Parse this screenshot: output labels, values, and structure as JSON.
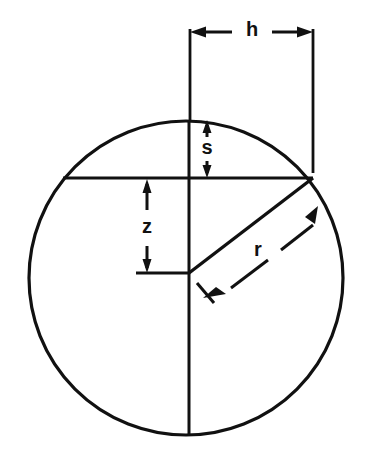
{
  "figure": {
    "type": "geometric-diagram",
    "background_color": "#ffffff",
    "line_color": "#111111"
  },
  "labels": {
    "h": "h",
    "s": "s",
    "z": "z",
    "r": "r"
  },
  "geometry": {
    "circle": {
      "center_x": 186,
      "center_y": 278,
      "radius": 157
    },
    "vertical_diameter": {
      "x": 189,
      "y_top": 121,
      "y_bottom": 435
    },
    "chord": {
      "y": 178,
      "x_left": 63,
      "x_right": 313
    },
    "h_dimension": {
      "y": 32,
      "x_start": 190,
      "x_end": 313,
      "label_x": 252,
      "label_y": 29
    },
    "h_extension_left": {
      "x": 190,
      "y_top": 29,
      "y_bottom": 121
    },
    "h_extension_right": {
      "x": 313,
      "y_top": 29,
      "y_bottom": 173
    },
    "s_dimension": {
      "x": 207,
      "y_top": 121,
      "y_bottom": 177,
      "label_x": 207,
      "label_y": 149
    },
    "z_dimension": {
      "x": 147,
      "y_top": 179,
      "y_bottom": 273,
      "label_x": 147,
      "label_y": 228
    },
    "z_base_line": {
      "y": 273,
      "x_left": 138,
      "x_right": 190
    },
    "radius_line": {
      "x_start": 189,
      "y_start": 273,
      "x_end": 313,
      "y_end": 178
    },
    "r_dimension": {
      "x_arrow_upper": 318,
      "y_arrow_upper": 206,
      "x_arrow_lower": 205,
      "y_arrow_lower": 297,
      "label_x": 258,
      "label_y": 251
    }
  }
}
